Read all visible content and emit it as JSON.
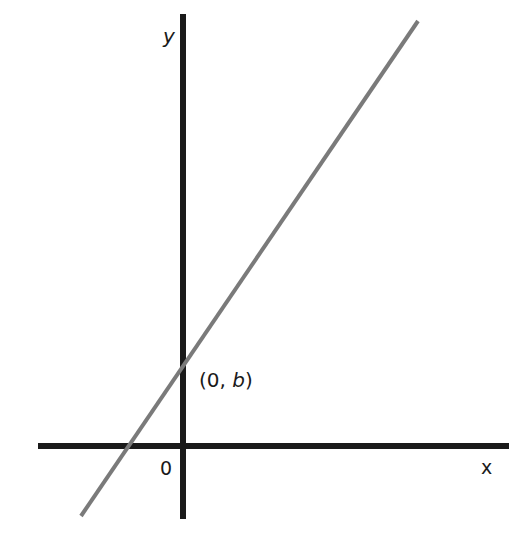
{
  "diagram": {
    "type": "line-on-axes",
    "axes": {
      "x_label": "x",
      "y_label": "y",
      "origin_label": "0",
      "color": "#1a1a1a"
    },
    "line": {
      "color": "#7a7a7a",
      "intercept_label_open": "(0, ",
      "intercept_label_var": "b",
      "intercept_label_close": ")"
    }
  }
}
